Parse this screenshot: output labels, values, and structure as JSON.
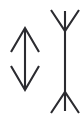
{
  "figure": {
    "name": "muller-lyer-illusion",
    "background_color": "#ffffff",
    "stroke_color": "#2b2b30",
    "stroke_width": 2.1,
    "canvas": {
      "width": 83,
      "height": 116
    },
    "shapes": [
      {
        "id": "left-double-arrow",
        "label": "double-headed-arrow-inward-fins",
        "shaft": {
          "x1": 25,
          "y1": 29,
          "x2": 25,
          "y2": 89
        },
        "head_top": {
          "tip_x": 25,
          "tip_y": 28,
          "left_x": 11,
          "left_y": 52,
          "right_x": 39,
          "right_y": 52
        },
        "head_bottom": {
          "tip_x": 25,
          "tip_y": 90,
          "left_x": 11,
          "left_y": 66,
          "right_x": 39,
          "right_y": 66
        }
      },
      {
        "id": "right-double-fin",
        "label": "vertical-line-outward-fins",
        "shaft": {
          "x1": 65,
          "y1": 11,
          "x2": 65,
          "y2": 111
        },
        "fin_top": {
          "vertex_x": 65,
          "vertex_y": 31,
          "left_x": 51,
          "left_y": 10,
          "right_x": 79,
          "right_y": 10
        },
        "fin_bottom": {
          "vertex_x": 65,
          "vertex_y": 92,
          "left_x": 51,
          "left_y": 113,
          "right_x": 79,
          "right_y": 113
        }
      }
    ]
  }
}
